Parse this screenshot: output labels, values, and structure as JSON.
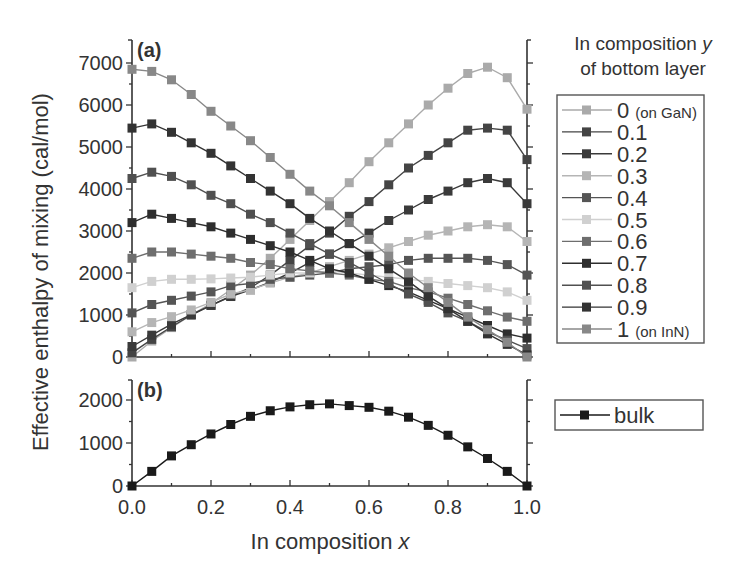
{
  "chart_data": [
    {
      "type": "line",
      "panel": "(a)",
      "xlabel": "In composition x",
      "ylabel": "Effective enthalpy of mixing (cal/mol)",
      "xlim": [
        0,
        1
      ],
      "ylim": [
        0,
        7000
      ],
      "xticks": [
        "0.0",
        "0.2",
        "0.4",
        "0.6",
        "0.8",
        "1.0"
      ],
      "yticks": [
        "0",
        "1000",
        "2000",
        "3000",
        "4000",
        "5000",
        "6000",
        "7000"
      ],
      "legend_title": "In composition y of bottom layer",
      "legend_position": "right",
      "x": [
        0,
        0.05,
        0.1,
        0.15,
        0.2,
        0.25,
        0.3,
        0.35,
        0.4,
        0.45,
        0.5,
        0.55,
        0.6,
        0.65,
        0.7,
        0.75,
        0.8,
        0.85,
        0.9,
        0.95,
        1.0
      ],
      "series": [
        {
          "name": "0",
          "note": "(on GaN)",
          "color": "#aaaaaa",
          "values": [
            0,
            380,
            700,
            1000,
            1280,
            1600,
            1950,
            2350,
            2800,
            3250,
            3700,
            4150,
            4650,
            5100,
            5550,
            6000,
            6400,
            6750,
            6900,
            6650,
            5900
          ]
        },
        {
          "name": "0.1",
          "color": "#444444",
          "values": [
            100,
            420,
            720,
            1000,
            1230,
            1450,
            1650,
            1950,
            2300,
            2650,
            2950,
            3350,
            3700,
            4100,
            4500,
            4800,
            5100,
            5400,
            5450,
            5400,
            4700
          ]
        },
        {
          "name": "0.2",
          "color": "#3a3a3a",
          "values": [
            250,
            520,
            780,
            1010,
            1230,
            1440,
            1600,
            1780,
            2000,
            2250,
            2450,
            2700,
            2950,
            3250,
            3500,
            3750,
            3950,
            4150,
            4250,
            4150,
            3650
          ]
        },
        {
          "name": "0.3",
          "color": "#b5b5b5",
          "values": [
            600,
            820,
            960,
            1120,
            1300,
            1500,
            1600,
            1760,
            1900,
            2000,
            2150,
            2300,
            2450,
            2600,
            2750,
            2900,
            3000,
            3100,
            3150,
            3100,
            2750
          ]
        },
        {
          "name": "0.4",
          "color": "#555555",
          "values": [
            1050,
            1250,
            1350,
            1450,
            1550,
            1700,
            1750,
            1850,
            1900,
            1950,
            2000,
            2100,
            2150,
            2200,
            2300,
            2350,
            2350,
            2350,
            2300,
            2200,
            1950
          ]
        },
        {
          "name": "0.5",
          "color": "#d0d0d0",
          "values": [
            1650,
            1800,
            1850,
            1850,
            1860,
            1880,
            1900,
            1950,
            2000,
            2000,
            2050,
            2000,
            1950,
            1900,
            1850,
            1800,
            1750,
            1700,
            1650,
            1550,
            1350
          ]
        },
        {
          "name": "0.6",
          "color": "#6e6e6e",
          "values": [
            2350,
            2500,
            2500,
            2450,
            2400,
            2350,
            2250,
            2200,
            2100,
            2050,
            2000,
            1950,
            1850,
            1800,
            1650,
            1550,
            1400,
            1250,
            1100,
            950,
            850
          ]
        },
        {
          "name": "0.7",
          "color": "#2e2e2e",
          "values": [
            3200,
            3400,
            3300,
            3200,
            3100,
            2950,
            2800,
            2650,
            2500,
            2300,
            2100,
            2000,
            1850,
            1700,
            1550,
            1350,
            1150,
            950,
            750,
            550,
            450
          ]
        },
        {
          "name": "0.8",
          "color": "#505050",
          "values": [
            4250,
            4400,
            4300,
            4100,
            3850,
            3650,
            3400,
            3200,
            2950,
            2700,
            2450,
            2250,
            2000,
            1750,
            1500,
            1300,
            1050,
            850,
            600,
            400,
            200
          ]
        },
        {
          "name": "0.9",
          "color": "#333333",
          "values": [
            5450,
            5550,
            5350,
            5100,
            4850,
            4550,
            4250,
            3950,
            3650,
            3300,
            3000,
            2700,
            2400,
            2100,
            1800,
            1450,
            1150,
            850,
            550,
            300,
            50
          ]
        },
        {
          "name": "1",
          "note": "(on InN)",
          "color": "#888888",
          "values": [
            6850,
            6800,
            6600,
            6250,
            5850,
            5500,
            5150,
            4750,
            4350,
            3950,
            3600,
            3200,
            2800,
            2400,
            2000,
            1650,
            1300,
            950,
            650,
            350,
            0
          ]
        }
      ]
    },
    {
      "type": "line",
      "panel": "(b)",
      "xlabel": "In composition x",
      "ylabel": "Effective enthalpy of mixing (cal/mol)",
      "xlim": [
        0,
        1
      ],
      "ylim": [
        0,
        2500
      ],
      "xticks": [
        "0.0",
        "0.2",
        "0.4",
        "0.6",
        "0.8",
        "1.0"
      ],
      "yticks": [
        "0",
        "1000",
        "2000"
      ],
      "x": [
        0,
        0.05,
        0.1,
        0.15,
        0.2,
        0.25,
        0.3,
        0.35,
        0.4,
        0.45,
        0.5,
        0.55,
        0.6,
        0.65,
        0.7,
        0.75,
        0.8,
        0.85,
        0.9,
        0.95,
        1.0
      ],
      "series": [
        {
          "name": "bulk",
          "color": "#1a1a1a",
          "values": [
            0,
            340,
            700,
            960,
            1210,
            1430,
            1620,
            1750,
            1840,
            1890,
            1910,
            1870,
            1830,
            1740,
            1600,
            1410,
            1180,
            910,
            640,
            340,
            0
          ]
        }
      ]
    }
  ],
  "labels": {
    "panel_a": "(a)",
    "panel_b": "(b)",
    "ylabel": "Effective enthalpy of mixing  (cal/mol)",
    "xlabel_main": "In composition ",
    "xlabel_var": "x",
    "legend_title_line1_main": "In composition ",
    "legend_title_line1_var": "y",
    "legend_title_line2": "of bottom layer",
    "bulk_label": "bulk"
  }
}
